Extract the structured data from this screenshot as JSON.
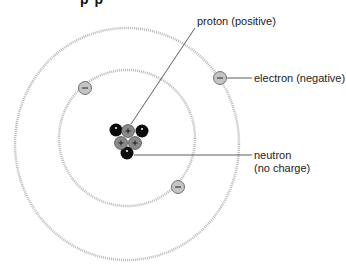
{
  "title_fragment": "p   p",
  "labels": {
    "proton": "proton (positive)",
    "electron": "electron (negative)",
    "neutron_line1": "neutron",
    "neutron_line2": "(no charge)"
  },
  "symbols": {
    "proton": "+",
    "electron": "−"
  },
  "colors": {
    "orbit": "#b0b0b0",
    "electron_fill": "#c4c4c4",
    "proton_fill": "#8a8a8a",
    "neutron_fill": "#0a0a0a",
    "leader_line": "#333333"
  },
  "orbits": [
    {
      "name": "inner",
      "cx": 127,
      "cy": 138,
      "rx": 68,
      "ry": 68
    },
    {
      "name": "outer",
      "cx": 127,
      "cy": 144,
      "rx": 112,
      "ry": 116
    }
  ],
  "electrons": [
    {
      "x": 85,
      "y": 88
    },
    {
      "x": 220,
      "y": 78
    },
    {
      "x": 178,
      "y": 187
    }
  ],
  "nucleus": {
    "protons": [
      {
        "x": 128,
        "y": 131
      },
      {
        "x": 121,
        "y": 143
      },
      {
        "x": 135,
        "y": 143
      }
    ],
    "neutrons": [
      {
        "x": 116,
        "y": 130
      },
      {
        "x": 142,
        "y": 131
      },
      {
        "x": 127,
        "y": 153
      }
    ]
  }
}
